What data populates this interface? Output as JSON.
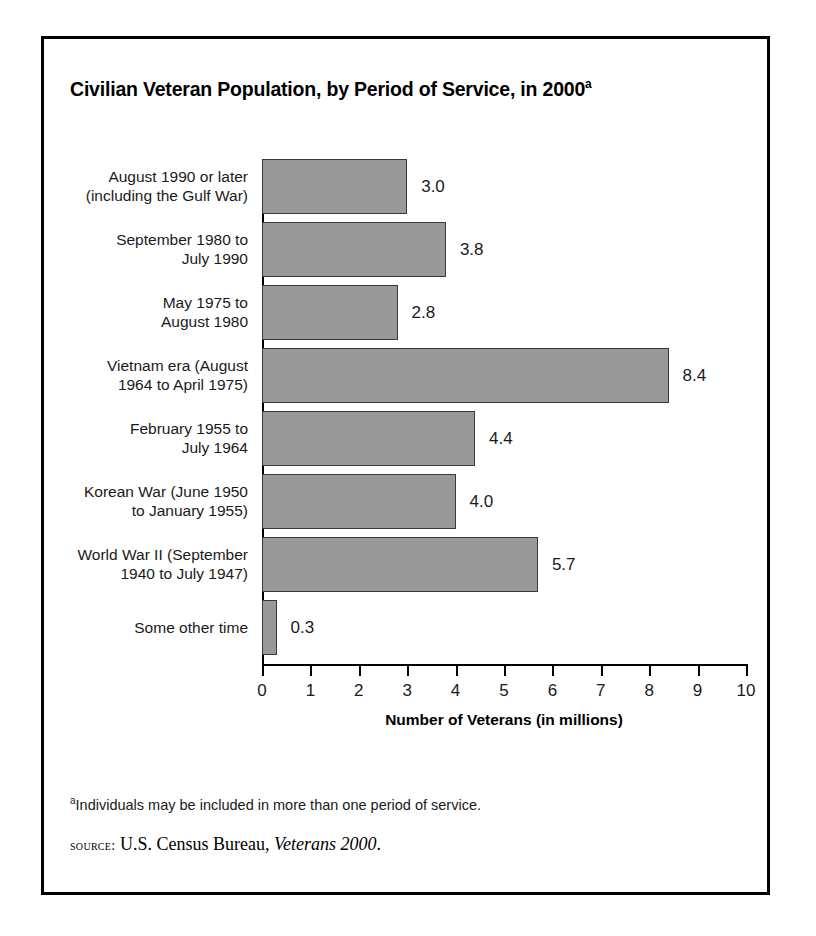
{
  "figure": {
    "title": "Civilian Veteran Population, by Period of Service, in 2000",
    "title_superscript": "a",
    "footnote_marker": "a",
    "footnote_text": "Individuals may be included in more than one period of service.",
    "source_label": "Source:",
    "source_publisher": "U.S. Census Bureau,",
    "source_title": "Veterans 2000",
    "source_period": "."
  },
  "chart_data": {
    "type": "bar",
    "orientation": "horizontal",
    "title": "Civilian Veteran Population, by Period of Service, in 2000",
    "xlabel": "Number of Veterans (in millions)",
    "ylabel": "",
    "xlim": [
      0,
      10
    ],
    "xticks": [
      "0",
      "1",
      "2",
      "3",
      "4",
      "5",
      "6",
      "7",
      "8",
      "9",
      "10"
    ],
    "grid": false,
    "legend": false,
    "bar_fill_color": "#999999",
    "bar_border_color": "#3a3a3a",
    "categories": [
      "August 1990 or later (including the Gulf War)",
      "September 1980 to July 1990",
      "May 1975 to August 1980",
      "Vietnam era (August 1964 to April 1975)",
      "February 1955 to July 1964",
      "Korean War (June 1950 to January 1955)",
      "World War II (September 1940 to July 1947)",
      "Some other time"
    ],
    "values": [
      3.0,
      3.8,
      2.8,
      8.4,
      4.4,
      4.0,
      5.7,
      0.3
    ],
    "value_labels": [
      "3.0",
      "3.8",
      "2.8",
      "8.4",
      "4.4",
      "4.0",
      "5.7",
      "0.3"
    ],
    "bars": [
      {
        "label_lines": [
          "August 1990 or later",
          "(including the Gulf War)"
        ],
        "value": 3.0,
        "value_label": "3.0"
      },
      {
        "label_lines": [
          "September 1980 to",
          "July 1990"
        ],
        "value": 3.8,
        "value_label": "3.8"
      },
      {
        "label_lines": [
          "May 1975 to",
          "August 1980"
        ],
        "value": 2.8,
        "value_label": "2.8"
      },
      {
        "label_lines": [
          "Vietnam era (August",
          "1964 to April 1975)"
        ],
        "value": 8.4,
        "value_label": "8.4"
      },
      {
        "label_lines": [
          "February 1955 to",
          "July 1964"
        ],
        "value": 4.4,
        "value_label": "4.4"
      },
      {
        "label_lines": [
          "Korean War (June 1950",
          "to January 1955)"
        ],
        "value": 4.0,
        "value_label": "4.0"
      },
      {
        "label_lines": [
          "World War II (September",
          "1940 to July 1947)"
        ],
        "value": 5.7,
        "value_label": "5.7"
      },
      {
        "label_lines": [
          "Some other time"
        ],
        "value": 0.3,
        "value_label": "0.3"
      }
    ]
  }
}
